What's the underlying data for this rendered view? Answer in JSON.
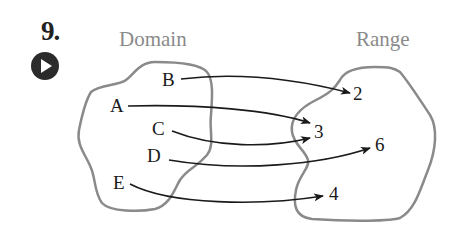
{
  "problem": {
    "number": "9.",
    "play_button_label": "play-video"
  },
  "diagram": {
    "domain_title": "Domain",
    "range_title": "Range",
    "domain": [
      "B",
      "A",
      "C",
      "D",
      "E"
    ],
    "range": [
      "2",
      "3",
      "6",
      "4"
    ],
    "mapping": [
      {
        "from": "B",
        "to": "2"
      },
      {
        "from": "A",
        "to": "3"
      },
      {
        "from": "C",
        "to": "3"
      },
      {
        "from": "D",
        "to": "6"
      },
      {
        "from": "E",
        "to": "4"
      }
    ],
    "colors": {
      "blob_stroke": "#8a8a8a",
      "arrow": "#1a1a1a",
      "title": "#8a8a8a",
      "play_button": "#2b2b2b"
    }
  }
}
